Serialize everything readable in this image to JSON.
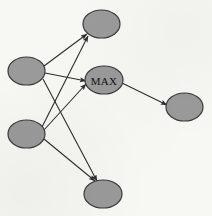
{
  "figure": {
    "type": "graph-diagram",
    "background_color": "#f7f7f4",
    "node_fill_color": "#9a9a9a",
    "node_stroke_color": "#3a3a3a",
    "edge_color": "#2e2e2e",
    "label_color": "#111111",
    "width": 212,
    "height": 216
  },
  "nodes": [
    {
      "id": "source-top",
      "label": "",
      "cx": 26.5,
      "cy": 71,
      "rx": 18.5,
      "ry": 14
    },
    {
      "id": "source-bottom",
      "label": "",
      "cx": 26.5,
      "cy": 134,
      "rx": 18.5,
      "ry": 14
    },
    {
      "id": "target-top",
      "label": "",
      "cx": 101.5,
      "cy": 24,
      "rx": 18.5,
      "ry": 14
    },
    {
      "id": "max",
      "label": "MAX",
      "cx": 104,
      "cy": 80,
      "rx": 19,
      "ry": 14
    },
    {
      "id": "target-bottom",
      "label": "",
      "cx": 103,
      "cy": 194,
      "rx": 19,
      "ry": 14
    },
    {
      "id": "output-right",
      "label": "",
      "cx": 184.5,
      "cy": 107,
      "rx": 18.5,
      "ry": 14
    }
  ],
  "edges": [
    {
      "from": "source-top",
      "to": "target-top",
      "x1": 44,
      "y1": 66,
      "x2": 87,
      "y2": 34
    },
    {
      "from": "source-top",
      "to": "max",
      "x1": 45,
      "y1": 73,
      "x2": 86,
      "y2": 81
    },
    {
      "from": "source-top",
      "to": "target-bottom",
      "x1": 43,
      "y1": 79,
      "x2": 97,
      "y2": 181
    },
    {
      "from": "source-bottom",
      "to": "target-top",
      "x1": 42,
      "y1": 127,
      "x2": 88,
      "y2": 36
    },
    {
      "from": "source-bottom",
      "to": "max",
      "x1": 44,
      "y1": 130,
      "x2": 86,
      "y2": 84
    },
    {
      "from": "source-bottom",
      "to": "target-bottom",
      "x1": 44,
      "y1": 139,
      "x2": 95,
      "y2": 181
    },
    {
      "from": "max",
      "to": "output-right",
      "x1": 122,
      "y1": 83,
      "x2": 167,
      "y2": 105
    }
  ]
}
